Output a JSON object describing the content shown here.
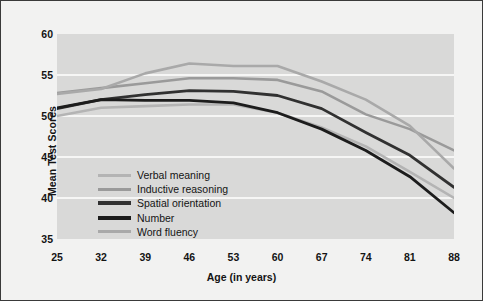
{
  "chart_data": {
    "type": "line",
    "title": "",
    "xlabel": "Age (in years)",
    "ylabel": "Mean Test Scores",
    "x": [
      25,
      32,
      39,
      46,
      53,
      60,
      67,
      74,
      81,
      88
    ],
    "xticklabels": [
      "25",
      "32",
      "39",
      "46",
      "53",
      "60",
      "67",
      "74",
      "81",
      "88"
    ],
    "yticklabels": [
      "35",
      "40",
      "45",
      "50",
      "55",
      "60"
    ],
    "yticks": [
      35,
      40,
      45,
      50,
      55,
      60
    ],
    "ylim": [
      35,
      60
    ],
    "xlim": [
      25,
      88
    ],
    "grid": "horizontal",
    "legend_position": "inside-lower-left",
    "plot_background": "#d9d9d8",
    "figure_background": "#f2f2f1",
    "gridline_color": "#ffffff",
    "series": [
      {
        "name": "Verbal meaning",
        "color": "#b4b4b4",
        "width": 2.6,
        "values": [
          50.0,
          51.0,
          51.2,
          51.4,
          51.4,
          50.4,
          48.6,
          46.3,
          43.2,
          40.0
        ]
      },
      {
        "name": "Inductive reasoning",
        "color": "#9a9a9a",
        "width": 2.6,
        "values": [
          52.8,
          53.4,
          54.0,
          54.6,
          54.6,
          54.4,
          53.0,
          50.2,
          48.4,
          45.8
        ]
      },
      {
        "name": "Spatial orientation",
        "color": "#313131",
        "width": 2.8,
        "values": [
          50.9,
          52.0,
          52.6,
          53.1,
          53.0,
          52.5,
          50.9,
          48.0,
          45.2,
          41.3
        ]
      },
      {
        "name": "Number",
        "color": "#1c1c1c",
        "width": 2.8,
        "values": [
          51.0,
          52.0,
          51.9,
          51.9,
          51.6,
          50.4,
          48.4,
          45.8,
          42.6,
          38.2
        ]
      },
      {
        "name": "Word fluency",
        "color": "#a9a9a9",
        "width": 2.6,
        "values": [
          52.7,
          53.3,
          55.2,
          56.4,
          56.1,
          56.1,
          54.2,
          52.0,
          48.8,
          43.6
        ]
      }
    ]
  },
  "legend": {
    "items": [
      {
        "label": "Verbal meaning",
        "color": "#b4b4b4",
        "width": 3
      },
      {
        "label": "Inductive reasoning",
        "color": "#9a9a9a",
        "width": 3
      },
      {
        "label": "Spatial orientation",
        "color": "#313131",
        "width": 4
      },
      {
        "label": "Number",
        "color": "#1c1c1c",
        "width": 4
      },
      {
        "label": "Word fluency",
        "color": "#a9a9a9",
        "width": 3
      }
    ]
  }
}
